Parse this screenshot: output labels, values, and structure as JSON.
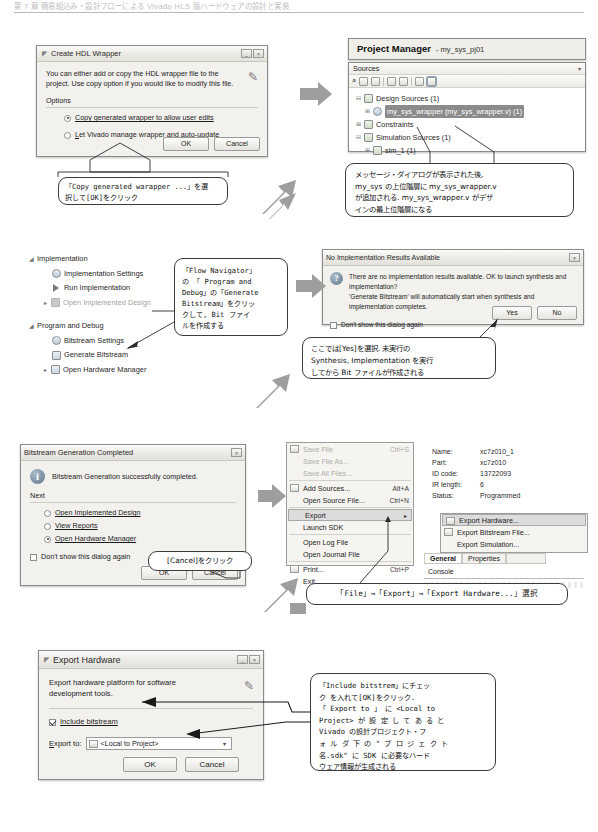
{
  "page": {
    "running_head": "第 7 章 簡易組込み・設計フローによる Vivado HLS 版ハードウェアの設計と実装"
  },
  "step1": {
    "dialog": {
      "title": "Create HDL Wrapper",
      "body_text": "You can either add or copy the HDL wrapper file to the project. Use copy option if you would like to modify this file.",
      "options_label": "Options",
      "option1": "Copy generated wrapper to allow user edits",
      "option2": "Let Vivado manage wrapper and auto-update",
      "selected_option": 1,
      "ok": "OK",
      "cancel": "Cancel"
    },
    "callout": "「Copy generated warapper ...」を選\n択して[OK]をクリック"
  },
  "step2": {
    "panel": {
      "header_title": "Project Manager",
      "header_subtitle": "- my_sys_pj01",
      "sources_label": "Sources",
      "tree": [
        {
          "label": "Design Sources (1)",
          "depth": 0,
          "expander": "-",
          "icon": "folder-icon"
        },
        {
          "label": "my_sys_wrapper (my_sys_wrapper.v) (1)",
          "depth": 1,
          "expander": "+",
          "icon": "module-icon",
          "selected": true
        },
        {
          "label": "Constraints",
          "depth": 0,
          "expander": "+",
          "icon": "folder-icon"
        },
        {
          "label": "Simulation Sources (1)",
          "depth": 0,
          "expander": "-",
          "icon": "folder-icon"
        },
        {
          "label": "sim_1 (1)",
          "depth": 1,
          "expander": "+",
          "icon": "folder-icon"
        }
      ]
    },
    "callout": "メッセージ・ダイアログが表示された後,\nmy_sys の上位階層に my_sys_wrapper.v\nが追加される. my_sys_wrapper.v がデザ\nインの最上位階層になる"
  },
  "step3": {
    "tree": [
      {
        "label": "Implementation",
        "depth": 0,
        "expander": "4",
        "icon": "section-icon",
        "dim": false
      },
      {
        "label": "Implementation Settings",
        "depth": 1,
        "expander": "",
        "icon": "gear-icon",
        "dim": false
      },
      {
        "label": "Run Implementation",
        "depth": 1,
        "expander": "",
        "icon": "play-icon",
        "dim": false
      },
      {
        "label": "Open Implemented Design",
        "depth": 1,
        "expander": ">",
        "icon": "design-icon",
        "dim": true
      },
      {
        "label": "Program and Debug",
        "depth": 0,
        "expander": "4",
        "icon": "section-icon",
        "dim": false
      },
      {
        "label": "Bitstream Settings",
        "depth": 1,
        "expander": "",
        "icon": "gear-icon",
        "dim": false
      },
      {
        "label": "Generate Bitstream",
        "depth": 1,
        "expander": "",
        "icon": "bitstream-icon",
        "dim": false
      },
      {
        "label": "Open Hardware Manager",
        "depth": 1,
        "expander": ">",
        "icon": "hardware-icon",
        "dim": false
      }
    ],
    "callout": "「Flow Navigator」\nの 「 Program and\nDebug」の「Generate\nBitstream」をクリッ\nクして, Bit ファイ\nルを作成する"
  },
  "step4": {
    "dialog": {
      "title": "No Implementation Results Available",
      "body_line1": "There are no implementation results available. OK to launch synthesis and implementation?",
      "body_line2": "'Generate Bitstream' will automatically start when synthesis and implementation completes.",
      "checkbox": "Don't show this dialog again",
      "yes": "Yes",
      "no": "No"
    },
    "callout": "ここでは[Yes]を選択. 未実行の\nSynthesis, Implementation を実行\nしてから Bit ファイルが作成される"
  },
  "step5": {
    "dialog": {
      "title": "Bitstream Generation Completed",
      "body_text": "Bitstream Generation successfully completed.",
      "next_label": "Next",
      "option1": "Open Implemented Design",
      "option2": "View Reports",
      "option3": "Open Hardware Manager",
      "selected_option": 3,
      "checkbox": "Don't show this dialog again",
      "ok": "OK",
      "cancel": "Cancel"
    },
    "callout": "[Cancel]をクリック"
  },
  "step6": {
    "file_menu": [
      {
        "label": "Save File",
        "accel": "Ctrl+S",
        "disabled": true,
        "icon": "save-icon"
      },
      {
        "label": "Save File As...",
        "accel": "",
        "disabled": true,
        "icon": ""
      },
      {
        "label": "Save All Files...",
        "accel": "",
        "disabled": true,
        "icon": ""
      },
      {
        "label": "Add Sources...",
        "accel": "Alt+A",
        "disabled": false,
        "icon": "add-icon"
      },
      {
        "label": "Open Source File...",
        "accel": "Ctrl+N",
        "disabled": false,
        "icon": ""
      },
      {
        "label": "Export",
        "accel": "",
        "disabled": false,
        "submenu": true,
        "highlight": true,
        "icon": ""
      },
      {
        "label": "Launch SDK",
        "accel": "",
        "disabled": false,
        "icon": ""
      },
      {
        "label": "Open Log File",
        "accel": "",
        "disabled": false,
        "icon": ""
      },
      {
        "label": "Open Journal File",
        "accel": "",
        "disabled": false,
        "icon": ""
      },
      {
        "label": "Print...",
        "accel": "Ctrl+P",
        "disabled": false,
        "icon": "print-icon"
      },
      {
        "label": "Exit",
        "accel": "",
        "disabled": false,
        "icon": ""
      }
    ],
    "export_submenu": [
      {
        "label": "Export Hardware...",
        "highlight": true,
        "icon": "hw-icon"
      },
      {
        "label": "Export Bitstream File...",
        "highlight": false,
        "icon": "bit-icon"
      },
      {
        "label": "Export Simulation...",
        "highlight": false,
        "icon": ""
      }
    ],
    "properties": [
      {
        "key": "Name:",
        "value": "xc7z010_1"
      },
      {
        "key": "Part:",
        "value": "xc7z010"
      },
      {
        "key": "ID code:",
        "value": "13722093"
      },
      {
        "key": "IR length:",
        "value": "6"
      },
      {
        "key": "Status:",
        "value": "Programmed"
      }
    ],
    "tabs": [
      {
        "label": "General",
        "active": true
      },
      {
        "label": "Properties",
        "active": false
      }
    ],
    "console_label": "Console",
    "callout": "「File」→「Export」→「Export Hardware...」選択"
  },
  "step7": {
    "dialog": {
      "title": "Export Hardware",
      "body_text": "Export hardware platform for software\ndevelopment tools.",
      "checkbox_label": "Include bitstream",
      "checkbox_checked": true,
      "export_to_label": "Export to:",
      "export_to_value": "<Local to Project>",
      "ok": "OK",
      "cancel": "Cancel"
    },
    "callout": "「Include bitstrem」にチェッ\nク を入れて[OK]をクリック.\n「 Export  to 」 に <Local  to\nProject> が 設 定 し て あ る と\nVivado の設計プロジェクト・フ\nォ ル ダ 下 の \" プ ロ ジ ェ ク ト\n名.sdk\" に SDK に必要なハード\nウェア情報が生成される"
  },
  "colors": {
    "arrow_gray": "#9a9a9a",
    "selection": "#8b8b8b",
    "dialog_bg": "#f2f1ee",
    "border": "#8a8a8a"
  }
}
